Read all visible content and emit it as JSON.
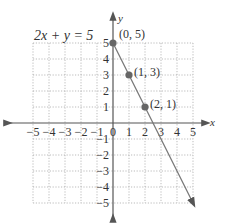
{
  "chart_data": {
    "type": "line",
    "title": "2x + y = 5",
    "xlabel": "x",
    "ylabel": "y",
    "xlim": [
      -5,
      5
    ],
    "ylim": [
      -5,
      5
    ],
    "grid": true,
    "x_ticks": [
      -5,
      -4,
      -3,
      -2,
      -1,
      0,
      1,
      2,
      3,
      4,
      5
    ],
    "y_ticks": [
      -5,
      -4,
      -3,
      -2,
      -1,
      1,
      2,
      3,
      4,
      5
    ],
    "series": [
      {
        "name": "2x + y = 5",
        "line": {
          "from": [
            0,
            5
          ],
          "to": [
            5,
            -5
          ]
        },
        "points": [
          {
            "x": 0,
            "y": 5,
            "label": "(0, 5)"
          },
          {
            "x": 1,
            "y": 3,
            "label": "(1, 3)"
          },
          {
            "x": 2,
            "y": 1,
            "label": "(2, 1)"
          }
        ]
      }
    ],
    "colors": {
      "line": "#777777",
      "point": "#666666",
      "grid": "#aaaaaa",
      "axis": "#555555"
    }
  },
  "labels": {
    "equation": "2x + y = 5",
    "x_axis": "x",
    "y_axis": "y",
    "p0": "(0, 5)",
    "p1": "(1, 3)",
    "p2": "(2, 1)"
  }
}
